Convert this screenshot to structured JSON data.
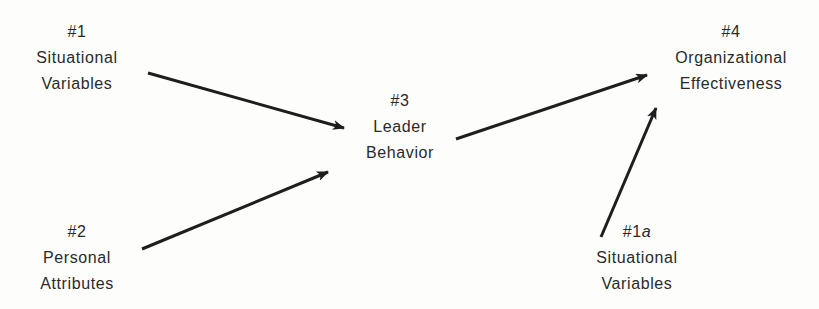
{
  "diagram": {
    "type": "path-diagram",
    "nodes": [
      {
        "id": "n1",
        "number": "#1",
        "suffix": "",
        "lines": [
          "Situational",
          "Variables"
        ]
      },
      {
        "id": "n2",
        "number": "#2",
        "suffix": "",
        "lines": [
          "Personal",
          "Attributes"
        ]
      },
      {
        "id": "n3",
        "number": "#3",
        "suffix": "",
        "lines": [
          "Leader",
          "Behavior"
        ]
      },
      {
        "id": "n4",
        "number": "#4",
        "suffix": "",
        "lines": [
          "Organizational",
          "Effectiveness"
        ]
      },
      {
        "id": "n1a",
        "number": "#1",
        "suffix": "a",
        "lines": [
          "Situational",
          "Variables"
        ]
      }
    ],
    "edges": [
      {
        "from": "#1 Situational Variables",
        "to": "#3 Leader Behavior"
      },
      {
        "from": "#2 Personal Attributes",
        "to": "#3 Leader Behavior"
      },
      {
        "from": "#3 Leader Behavior",
        "to": "#4 Organizational Effectiveness"
      },
      {
        "from": "#1a Situational Variables",
        "to": "#4 Organizational Effectiveness"
      }
    ],
    "colors": {
      "text": "#2a2a2a",
      "arrow": "#1e1e1e",
      "background": "#fdfdfb"
    }
  }
}
